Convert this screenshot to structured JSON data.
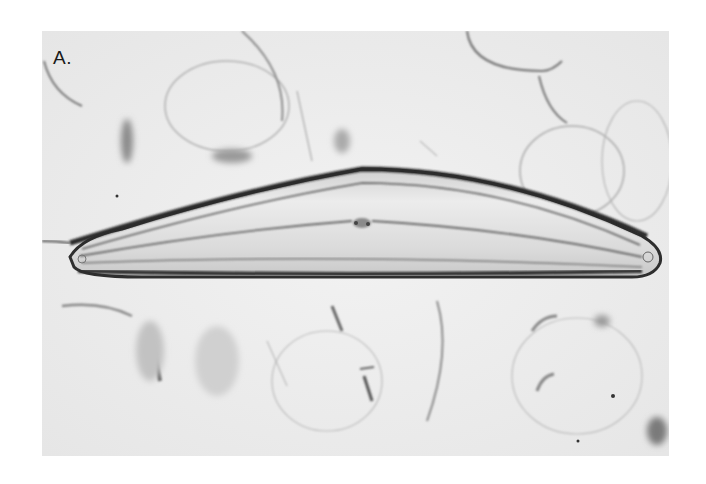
{
  "figure": {
    "panel_label": "A.",
    "colors": {
      "page_background": "#ffffff",
      "field_background": "#eeeeee",
      "valve_outline": "#2e2e2e",
      "valve_interior": "#e4e4e4",
      "debris": "#9a9a9a"
    }
  }
}
